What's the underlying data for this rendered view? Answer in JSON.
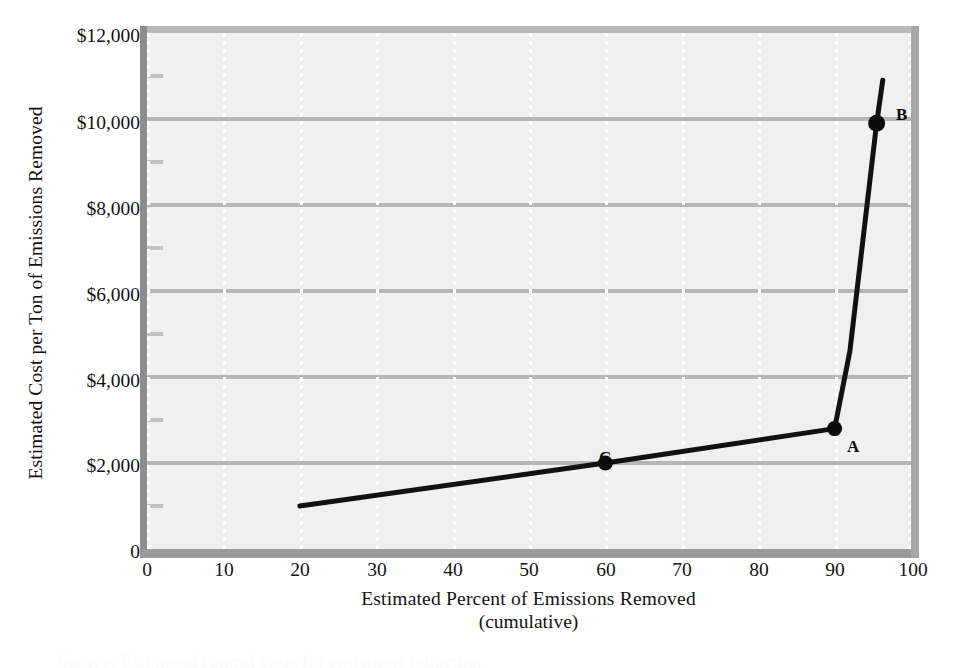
{
  "chart_data": {
    "type": "line",
    "title": "",
    "xlabel": "Estimated Percent of Emissions Removed",
    "xlabel_line2": "(cumulative)",
    "ylabel": "Estimated Cost per Ton of Emissions Removed",
    "xlim": [
      0,
      100
    ],
    "ylim": [
      0,
      12000
    ],
    "x_ticks": [
      0,
      10,
      20,
      30,
      40,
      50,
      60,
      70,
      80,
      90,
      100
    ],
    "x_tick_labels": [
      "0",
      "10",
      "20",
      "30",
      "40",
      "50",
      "60",
      "70",
      "80",
      "90",
      "100"
    ],
    "y_ticks": [
      0,
      2000,
      4000,
      6000,
      8000,
      10000,
      12000
    ],
    "y_tick_labels": [
      "0",
      "$2,000",
      "$4,000",
      "$6,000",
      "$8,000",
      "$10,000",
      "$12,000"
    ],
    "y_minor_ticks": [
      1000,
      3000,
      5000,
      7000,
      9000,
      11000
    ],
    "grid": {
      "horizontal": true,
      "vertical": true,
      "horizontal_style": "solid-gray",
      "vertical_style": "dotted-white"
    },
    "legend": null,
    "series": [
      {
        "name": "Marginal abatement cost curve",
        "color": "#111111",
        "x": [
          20,
          60,
          90,
          92,
          95.5,
          96.3
        ],
        "y": [
          1000,
          2000,
          2800,
          4600,
          9900,
          10900
        ]
      }
    ],
    "annotated_points": [
      {
        "label": "C",
        "x": 60,
        "y": 2000
      },
      {
        "label": "A",
        "x": 90,
        "y": 2800
      },
      {
        "label": "B",
        "x": 95.5,
        "y": 9900
      }
    ]
  },
  "axes": {
    "y_title": "Estimated Cost per Ton of Emissions Removed",
    "x_title_line1": "Estimated Percent of Emissions Removed",
    "x_title_line2": "(cumulative)",
    "y_labels": [
      "$12,000",
      "$10,000",
      "$8,000",
      "$6,000",
      "$4,000",
      "$2,000",
      "0"
    ],
    "x_labels": [
      "0",
      "10",
      "20",
      "30",
      "40",
      "50",
      "60",
      "70",
      "80",
      "90",
      "100"
    ]
  },
  "markers": {
    "a": "A",
    "b": "B",
    "c": "C"
  },
  "caption": {
    "partial_text": "Source: Estimated control costs for emissions reduction"
  },
  "colors": {
    "plot_background": "#f0f0f0",
    "page_background": "#ffffff",
    "gridline": "#b6b6b6",
    "vertical_gridline": "#ffffff",
    "series_line": "#111111",
    "frame_top": "#b9b9b9",
    "frame_left": "#8d8d8d",
    "frame_bottom": "#9a9a9a",
    "frame_right": "#a7a7a7",
    "text": "#121212"
  }
}
